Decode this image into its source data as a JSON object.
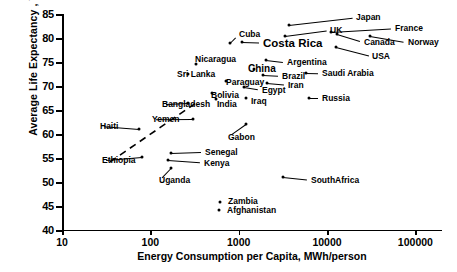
{
  "chart_data": {
    "type": "scatter",
    "title": "",
    "xlabel": "Energy Consumption per Capita, MWh/person",
    "ylabel": "Average Life Expectancy , Years",
    "xscale": "log",
    "xlim": [
      10,
      200000
    ],
    "ylim": [
      40,
      85
    ],
    "xticks": [
      10,
      100,
      1000,
      10000,
      100000
    ],
    "xtick_labels": [
      "10",
      "100",
      "1000",
      "10000",
      "100000"
    ],
    "yticks": [
      40,
      45,
      50,
      55,
      60,
      65,
      70,
      75,
      80,
      85
    ],
    "ytick_labels": [
      "40",
      "45",
      "50",
      "55",
      "60",
      "65",
      "70",
      "75",
      "80",
      "85"
    ],
    "grid": false,
    "legend": false,
    "trendline": {
      "style": "dashed",
      "x": [
        35,
        330
      ],
      "y": [
        54.2,
        66.5
      ]
    },
    "points": [
      {
        "label": "Japan",
        "x": 3700,
        "y": 82.8,
        "lx": 356,
        "ly": 17,
        "anchor": "left",
        "emph": "normal"
      },
      {
        "label": "France",
        "x": 11000,
        "y": 81.3,
        "lx": 395,
        "ly": 28,
        "anchor": "left",
        "emph": "normal"
      },
      {
        "label": "Norway",
        "x": 31000,
        "y": 80.5,
        "lx": 408,
        "ly": 42,
        "anchor": "left",
        "emph": "normal"
      },
      {
        "label": "UK",
        "x": 3300,
        "y": 80.4,
        "lx": 330,
        "ly": 30,
        "anchor": "left",
        "emph": "normal"
      },
      {
        "label": "Canada",
        "x": 13000,
        "y": 80.9,
        "lx": 364,
        "ly": 42,
        "anchor": "left",
        "emph": "normal"
      },
      {
        "label": "USA",
        "x": 12500,
        "y": 78.2,
        "lx": 372,
        "ly": 56,
        "anchor": "left",
        "emph": "normal"
      },
      {
        "label": "Costa Rica",
        "x": 1100,
        "y": 79.1,
        "lx": 263,
        "ly": 43,
        "anchor": "left",
        "emph": "big"
      },
      {
        "label": "Cuba",
        "x": 800,
        "y": 79.0,
        "lx": 239,
        "ly": 34,
        "anchor": "left",
        "emph": "normal"
      },
      {
        "label": "Nicaragua",
        "x": 330,
        "y": 74.5,
        "lx": 195,
        "ly": 59,
        "anchor": "left",
        "emph": "normal"
      },
      {
        "label": "Argentina",
        "x": 2050,
        "y": 75.5,
        "lx": 287,
        "ly": 62,
        "anchor": "left",
        "emph": "normal"
      },
      {
        "label": "Sri Lanka",
        "x": 270,
        "y": 72.6,
        "lx": 177,
        "ly": 74,
        "anchor": "left",
        "emph": "normal"
      },
      {
        "label": "China",
        "x": 1500,
        "y": 73.5,
        "lx": 248,
        "ly": 68,
        "anchor": "left",
        "emph": "mid"
      },
      {
        "label": "Brazil",
        "x": 1900,
        "y": 72.3,
        "lx": 282,
        "ly": 76,
        "anchor": "left",
        "emph": "normal"
      },
      {
        "label": "Saudi Arabia",
        "x": 5800,
        "y": 72.8,
        "lx": 322,
        "ly": 73,
        "anchor": "left",
        "emph": "normal"
      },
      {
        "label": "Paraguay",
        "x": 720,
        "y": 71.0,
        "lx": 226,
        "ly": 82,
        "anchor": "left",
        "emph": "normal"
      },
      {
        "label": "Iran",
        "x": 2100,
        "y": 70.6,
        "lx": 288,
        "ly": 85,
        "anchor": "left",
        "emph": "normal"
      },
      {
        "label": "Egypt",
        "x": 1150,
        "y": 69.8,
        "lx": 262,
        "ly": 90,
        "anchor": "left",
        "emph": "normal"
      },
      {
        "label": "Bolivia",
        "x": 500,
        "y": 68.5,
        "lx": 211,
        "ly": 95,
        "anchor": "left",
        "emph": "normal"
      },
      {
        "label": "India",
        "x": 560,
        "y": 67.2,
        "lx": 217,
        "ly": 104,
        "anchor": "left",
        "emph": "normal"
      },
      {
        "label": "Iraq",
        "x": 1200,
        "y": 67.6,
        "lx": 251,
        "ly": 101,
        "anchor": "left",
        "emph": "normal"
      },
      {
        "label": "Bangladesh",
        "x": 270,
        "y": 66.5,
        "lx": 162,
        "ly": 104,
        "anchor": "left",
        "emph": "normal"
      },
      {
        "label": "Russia",
        "x": 6200,
        "y": 67.5,
        "lx": 322,
        "ly": 98,
        "anchor": "left",
        "emph": "normal"
      },
      {
        "label": "Yemen",
        "x": 300,
        "y": 63.2,
        "lx": 152,
        "ly": 119,
        "anchor": "left",
        "emph": "normal"
      },
      {
        "label": "Gabon",
        "x": 1200,
        "y": 62.0,
        "lx": 228,
        "ly": 137,
        "anchor": "left",
        "emph": "normal"
      },
      {
        "label": "Haiti",
        "x": 75,
        "y": 61.0,
        "lx": 100,
        "ly": 126,
        "anchor": "left",
        "emph": "normal"
      },
      {
        "label": "Senegal",
        "x": 170,
        "y": 56.0,
        "lx": 205,
        "ly": 152,
        "anchor": "left",
        "emph": "normal"
      },
      {
        "label": "Ethiopia",
        "x": 80,
        "y": 55.3,
        "lx": 102,
        "ly": 160,
        "anchor": "left",
        "emph": "normal"
      },
      {
        "label": "Kenya",
        "x": 160,
        "y": 54.5,
        "lx": 204,
        "ly": 163,
        "anchor": "left",
        "emph": "normal"
      },
      {
        "label": "Uganda",
        "x": 170,
        "y": 53.0,
        "lx": 159,
        "ly": 180,
        "anchor": "left",
        "emph": "normal"
      },
      {
        "label": "SouthAfrica",
        "x": 3200,
        "y": 51.0,
        "lx": 311,
        "ly": 180,
        "anchor": "left",
        "emph": "normal"
      },
      {
        "label": "Zambia",
        "x": 620,
        "y": 45.8,
        "lx": 228,
        "ly": 201,
        "anchor": "left",
        "emph": "normal"
      },
      {
        "label": "Afghanistan",
        "x": 600,
        "y": 44.2,
        "lx": 227,
        "ly": 210,
        "anchor": "left",
        "emph": "normal"
      }
    ]
  },
  "axes": {
    "x_title": "Energy Consumption per Capita, MWh/person",
    "y_title": "Average Life Expectancy , Years"
  }
}
